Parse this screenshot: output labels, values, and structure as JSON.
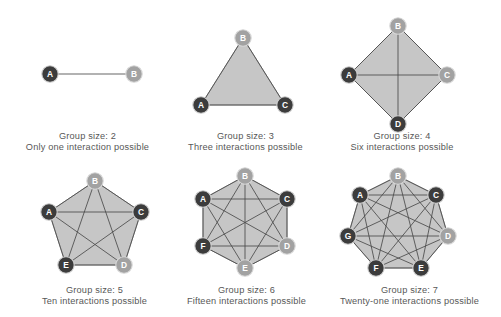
{
  "figure": {
    "background_color": "#ffffff",
    "caption_color": "#575757",
    "node_dark_color": "#3c3c3c",
    "node_light_color": "#a2a2a2",
    "polygon_fill_color": "#c6c6c6",
    "edge_color": "#4a4a4a"
  },
  "chart_data": {
    "type": "diagram",
    "title": "",
    "panels": [
      {
        "id": "panel-group-2",
        "group_size": 2,
        "interactions": 1,
        "size_label": "Group size: 2",
        "interactions_label": "Only one interaction possible",
        "shape": "line",
        "nodes": [
          {
            "label": "A",
            "x": 50,
            "y": 74,
            "shade": "dark"
          },
          {
            "label": "B",
            "x": 134,
            "y": 74,
            "shade": "light"
          }
        ],
        "edges": [
          [
            0,
            1
          ]
        ]
      },
      {
        "id": "panel-group-3",
        "group_size": 3,
        "interactions": 3,
        "size_label": "Group size: 3",
        "interactions_label": "Three interactions possible",
        "shape": "triangle",
        "nodes": [
          {
            "label": "B",
            "x": 243,
            "y": 38,
            "shade": "light"
          },
          {
            "label": "C",
            "x": 285,
            "y": 105,
            "shade": "dark"
          },
          {
            "label": "A",
            "x": 201,
            "y": 105,
            "shade": "dark"
          }
        ],
        "edges": [
          [
            0,
            1
          ],
          [
            1,
            2
          ],
          [
            2,
            0
          ]
        ]
      },
      {
        "id": "panel-group-4",
        "group_size": 4,
        "interactions": 6,
        "size_label": "Group size: 4",
        "interactions_label": "Six interactions possible",
        "shape": "quadrilateral",
        "nodes": [
          {
            "label": "B",
            "x": 398,
            "y": 26,
            "shade": "light"
          },
          {
            "label": "C",
            "x": 447,
            "y": 75,
            "shade": "light"
          },
          {
            "label": "D",
            "x": 398,
            "y": 124,
            "shade": "dark"
          },
          {
            "label": "A",
            "x": 349,
            "y": 75,
            "shade": "dark"
          }
        ],
        "edges": [
          [
            0,
            1
          ],
          [
            1,
            2
          ],
          [
            2,
            3
          ],
          [
            3,
            0
          ],
          [
            0,
            2
          ],
          [
            1,
            3
          ]
        ]
      },
      {
        "id": "panel-group-5",
        "group_size": 5,
        "interactions": 10,
        "size_label": "Group size: 5",
        "interactions_label": "Ten interactions possible",
        "shape": "pentagon",
        "nodes": [
          {
            "label": "B",
            "x": 95,
            "y": 181,
            "shade": "light"
          },
          {
            "label": "C",
            "x": 141,
            "y": 212,
            "shade": "dark"
          },
          {
            "label": "D",
            "x": 124,
            "y": 265,
            "shade": "light"
          },
          {
            "label": "E",
            "x": 66,
            "y": 265,
            "shade": "dark"
          },
          {
            "label": "A",
            "x": 49,
            "y": 212,
            "shade": "dark"
          }
        ],
        "edges": [
          [
            0,
            1
          ],
          [
            1,
            2
          ],
          [
            2,
            3
          ],
          [
            3,
            4
          ],
          [
            4,
            0
          ],
          [
            0,
            2
          ],
          [
            0,
            3
          ],
          [
            1,
            3
          ],
          [
            1,
            4
          ],
          [
            2,
            4
          ]
        ]
      },
      {
        "id": "panel-group-6",
        "group_size": 6,
        "interactions": 15,
        "size_label": "Group size: 6",
        "interactions_label": "Fifteen interactions possible",
        "shape": "hexagon",
        "nodes": [
          {
            "label": "B",
            "x": 245,
            "y": 176,
            "shade": "light"
          },
          {
            "label": "C",
            "x": 287,
            "y": 199,
            "shade": "dark"
          },
          {
            "label": "D",
            "x": 287,
            "y": 246,
            "shade": "light"
          },
          {
            "label": "E",
            "x": 245,
            "y": 268,
            "shade": "light"
          },
          {
            "label": "F",
            "x": 203,
            "y": 246,
            "shade": "dark"
          },
          {
            "label": "A",
            "x": 203,
            "y": 199,
            "shade": "dark"
          }
        ],
        "edges": [
          [
            0,
            1
          ],
          [
            1,
            2
          ],
          [
            2,
            3
          ],
          [
            3,
            4
          ],
          [
            4,
            5
          ],
          [
            5,
            0
          ],
          [
            0,
            2
          ],
          [
            0,
            3
          ],
          [
            0,
            4
          ],
          [
            1,
            3
          ],
          [
            1,
            4
          ],
          [
            1,
            5
          ],
          [
            2,
            4
          ],
          [
            2,
            5
          ],
          [
            3,
            5
          ]
        ]
      },
      {
        "id": "panel-group-7",
        "group_size": 7,
        "interactions": 21,
        "size_label": "Group size: 7",
        "interactions_label": "Twenty-one interactions possible",
        "shape": "heptagon",
        "nodes": [
          {
            "label": "B",
            "x": 398,
            "y": 176,
            "shade": "light"
          },
          {
            "label": "C",
            "x": 436,
            "y": 195,
            "shade": "dark"
          },
          {
            "label": "D",
            "x": 448,
            "y": 236,
            "shade": "light"
          },
          {
            "label": "E",
            "x": 421,
            "y": 268,
            "shade": "dark"
          },
          {
            "label": "F",
            "x": 376,
            "y": 268,
            "shade": "dark"
          },
          {
            "label": "G",
            "x": 348,
            "y": 236,
            "shade": "dark"
          },
          {
            "label": "A",
            "x": 360,
            "y": 195,
            "shade": "dark"
          }
        ],
        "edges": [
          [
            0,
            1
          ],
          [
            1,
            2
          ],
          [
            2,
            3
          ],
          [
            3,
            4
          ],
          [
            4,
            5
          ],
          [
            5,
            6
          ],
          [
            6,
            0
          ],
          [
            0,
            2
          ],
          [
            0,
            3
          ],
          [
            0,
            4
          ],
          [
            0,
            5
          ],
          [
            1,
            3
          ],
          [
            1,
            4
          ],
          [
            1,
            5
          ],
          [
            1,
            6
          ],
          [
            2,
            4
          ],
          [
            2,
            5
          ],
          [
            2,
            6
          ],
          [
            3,
            5
          ],
          [
            3,
            6
          ],
          [
            4,
            6
          ]
        ]
      }
    ],
    "caption_positions": [
      {
        "id": "caption-group-2",
        "x": 0,
        "y": 131,
        "width": 175
      },
      {
        "id": "caption-group-3",
        "x": 163,
        "y": 131,
        "width": 165
      },
      {
        "id": "caption-group-4",
        "x": 322,
        "y": 131,
        "width": 160
      },
      {
        "id": "caption-group-5",
        "x": 3,
        "y": 285,
        "width": 183
      },
      {
        "id": "caption-group-6",
        "x": 165,
        "y": 285,
        "width": 163
      },
      {
        "id": "caption-group-7",
        "x": 318,
        "y": 285,
        "width": 183
      }
    ]
  }
}
